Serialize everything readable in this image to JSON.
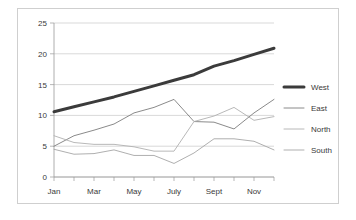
{
  "chart_data": {
    "type": "line",
    "title": "",
    "xlabel": "",
    "ylabel": "",
    "ylim": [
      0,
      25
    ],
    "yticks": [
      0,
      5,
      10,
      15,
      20,
      25
    ],
    "ytick_labels": [
      "0",
      "5",
      "10",
      "15",
      "20",
      "25"
    ],
    "grid": true,
    "legend_position": "right",
    "x": [
      "Jan",
      "Feb",
      "Mar",
      "Apr",
      "May",
      "June",
      "July",
      "Aug",
      "Sept",
      "Oct",
      "Nov",
      "Dec"
    ],
    "xtick_labels": [
      "Jan",
      "Mar",
      "May",
      "July",
      "Sept",
      "Nov"
    ],
    "xtick_label_indices": [
      0,
      2,
      4,
      6,
      8,
      10
    ],
    "series": [
      {
        "name": "West",
        "color": "#3b3b3b",
        "width": 3.0,
        "values": [
          10.6,
          11.4,
          12.2,
          13.0,
          13.9,
          14.8,
          15.7,
          16.6,
          18.0,
          18.9,
          19.9,
          20.9
        ]
      },
      {
        "name": "East",
        "color": "#7d7d7d",
        "width": 0.9,
        "values": [
          5.0,
          6.7,
          7.6,
          8.6,
          10.4,
          11.3,
          12.6,
          9.0,
          8.9,
          7.8,
          10.4,
          12.6
        ]
      },
      {
        "name": "North",
        "color": "#b0b0b0",
        "width": 0.9,
        "values": [
          6.7,
          5.6,
          5.3,
          5.3,
          4.9,
          4.2,
          4.2,
          9.0,
          9.9,
          11.3,
          9.2,
          9.8
        ]
      },
      {
        "name": "South",
        "color": "#a6a6a6",
        "width": 0.9,
        "values": [
          4.5,
          3.7,
          3.8,
          4.4,
          3.5,
          3.5,
          2.2,
          3.9,
          6.2,
          6.2,
          5.8,
          4.4
        ]
      }
    ]
  },
  "legend": {
    "items": [
      {
        "label": "West"
      },
      {
        "label": "East"
      },
      {
        "label": "North"
      },
      {
        "label": "South"
      }
    ]
  }
}
